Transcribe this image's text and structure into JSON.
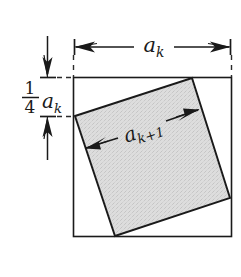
{
  "figure": {
    "labels": {
      "outer_side": "a",
      "outer_side_sub": "k",
      "inner_side": "a",
      "inner_side_sub": "k+1",
      "offset_numerator": "1",
      "offset_denominator": "4",
      "offset_var": "a",
      "offset_var_sub": "k"
    },
    "colors": {
      "stroke": "#1a1a1a",
      "inner_fill": "#dcdcdc",
      "background": "#ffffff",
      "dashed": "#2b2b2b"
    },
    "geometry": {
      "outer_square": {
        "left": 73,
        "top": 77,
        "right": 232,
        "bottom": 237
      },
      "inner_square_vertices": [
        [
          75,
          116
        ],
        [
          192,
          78
        ],
        [
          230,
          198
        ],
        [
          115,
          236
        ]
      ],
      "top_dimension": {
        "y": 47,
        "x_start": 73,
        "x_end": 232
      },
      "left_dimension": {
        "x": 47,
        "y_top": 77,
        "y_bottom": 116
      }
    }
  }
}
